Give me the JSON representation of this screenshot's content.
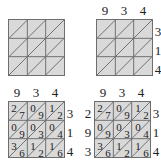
{
  "colors": {
    "cell_fill": "#d9d9d9",
    "grid_line": "#6e6e6e",
    "text": "#222222"
  },
  "panels": [
    {
      "id": "step-1",
      "top_labels": [
        "",
        "",
        ""
      ],
      "right_labels": [
        "",
        "",
        ""
      ],
      "left_labels": [
        "",
        "",
        ""
      ],
      "cells": [
        [
          {
            "tens": "",
            "ones": ""
          },
          {
            "tens": "",
            "ones": ""
          },
          {
            "tens": "",
            "ones": ""
          }
        ],
        [
          {
            "tens": "",
            "ones": ""
          },
          {
            "tens": "",
            "ones": ""
          },
          {
            "tens": "",
            "ones": ""
          }
        ],
        [
          {
            "tens": "",
            "ones": ""
          },
          {
            "tens": "",
            "ones": ""
          },
          {
            "tens": "",
            "ones": ""
          }
        ]
      ]
    },
    {
      "id": "step-2",
      "top_labels": [
        "9",
        "3",
        "4"
      ],
      "right_labels": [
        "3",
        "1",
        "4"
      ],
      "left_labels": [
        "",
        "",
        ""
      ],
      "cells": [
        [
          {
            "tens": "",
            "ones": ""
          },
          {
            "tens": "",
            "ones": ""
          },
          {
            "tens": "",
            "ones": ""
          }
        ],
        [
          {
            "tens": "",
            "ones": ""
          },
          {
            "tens": "",
            "ones": ""
          },
          {
            "tens": "",
            "ones": ""
          }
        ],
        [
          {
            "tens": "",
            "ones": ""
          },
          {
            "tens": "",
            "ones": ""
          },
          {
            "tens": "",
            "ones": ""
          }
        ]
      ]
    },
    {
      "id": "step-3",
      "top_labels": [
        "9",
        "3",
        "4"
      ],
      "right_labels": [
        "3",
        "1",
        "4"
      ],
      "left_labels": [
        "",
        "",
        ""
      ],
      "cells": [
        [
          {
            "tens": "2",
            "ones": "7"
          },
          {
            "tens": "0",
            "ones": "9"
          },
          {
            "tens": "1",
            "ones": "2"
          }
        ],
        [
          {
            "tens": "0",
            "ones": "9"
          },
          {
            "tens": "0",
            "ones": "3"
          },
          {
            "tens": "0",
            "ones": "4"
          }
        ],
        [
          {
            "tens": "3",
            "ones": "6"
          },
          {
            "tens": "1",
            "ones": "2"
          },
          {
            "tens": "1",
            "ones": "6"
          }
        ]
      ]
    },
    {
      "id": "step-4",
      "top_labels": [
        "9",
        "3",
        "4"
      ],
      "right_labels": [
        "3",
        "1",
        "4"
      ],
      "left_labels": [
        "2",
        "9",
        "3"
      ],
      "cells": [
        [
          {
            "tens": "2",
            "ones": "7"
          },
          {
            "tens": "0",
            "ones": "9"
          },
          {
            "tens": "1",
            "ones": "2"
          }
        ],
        [
          {
            "tens": "0",
            "ones": "9"
          },
          {
            "tens": "0",
            "ones": "3"
          },
          {
            "tens": "0",
            "ones": "4"
          }
        ],
        [
          {
            "tens": "3",
            "ones": "6"
          },
          {
            "tens": "1",
            "ones": "2"
          },
          {
            "tens": "1",
            "ones": "6"
          }
        ]
      ]
    }
  ]
}
